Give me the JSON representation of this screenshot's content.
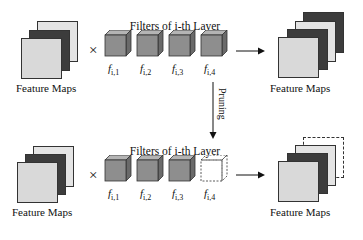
{
  "diagram": {
    "top_row": {
      "input_maps_label": "Feature Maps",
      "operator": "×",
      "filters_title": "Filters of i-th Layer",
      "filters": [
        {
          "label": "f",
          "sub": "i,1",
          "pruned": false
        },
        {
          "label": "f",
          "sub": "i,2",
          "pruned": false
        },
        {
          "label": "f",
          "sub": "i,3",
          "pruned": false
        },
        {
          "label": "f",
          "sub": "i,4",
          "pruned": false
        }
      ],
      "output_maps_label": "Feature Maps",
      "output_map_count": 4
    },
    "transition": {
      "label": "Pruning"
    },
    "bottom_row": {
      "input_maps_label": "Feature Maps",
      "operator": "×",
      "filters_title": "Filters of i-th Layer",
      "filters": [
        {
          "label": "f",
          "sub": "i,1",
          "pruned": false
        },
        {
          "label": "f",
          "sub": "i,2",
          "pruned": false
        },
        {
          "label": "f",
          "sub": "i,3",
          "pruned": false
        },
        {
          "label": "f",
          "sub": "i,4",
          "pruned": true
        }
      ],
      "output_maps_label": "Feature Maps",
      "output_map_count": 4,
      "output_map_pruned_index": 4
    },
    "colors": {
      "light_map": "#d9d9d9",
      "dark_map": "#3c3c3c",
      "cube_front": "#8e8e8e",
      "cube_top": "#b4b4b4",
      "cube_side": "#6a6a6a",
      "outline": "#333333"
    }
  }
}
